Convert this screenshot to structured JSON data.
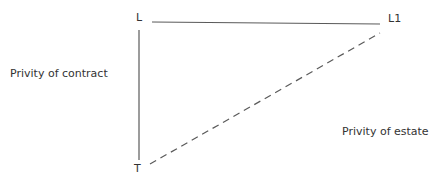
{
  "diagram": {
    "nodes": {
      "landlord": "L",
      "assignee_landlord": "L1",
      "tenant": "T"
    },
    "relations": {
      "contract": "Privity of contract",
      "estate": "Privity of estate"
    },
    "edges": [
      {
        "from": "L",
        "to": "L1",
        "style": "solid"
      },
      {
        "from": "L",
        "to": "T",
        "style": "solid"
      },
      {
        "from": "T",
        "to": "L1",
        "style": "dashed"
      }
    ],
    "colors": {
      "line": "#5a5a5a",
      "text": "#333333"
    }
  }
}
